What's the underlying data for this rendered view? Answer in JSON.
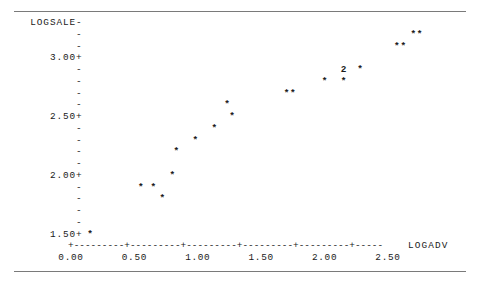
{
  "page": {
    "clipped_header_remnant": "-  -  - . - . -   -  .  -  -",
    "background_color": "#ffffff",
    "text_color": "#1a1a1a",
    "rule_color": "#7a7a7a"
  },
  "plot": {
    "type": "character-scatter",
    "y_axis": {
      "name": "LOGSALE",
      "tick_labels": [
        "3.00",
        "2.50",
        "2.00",
        "1.50"
      ],
      "major_tick_glyph": "+",
      "minor_tick_glyph": "-",
      "name_tick_glyph": "-",
      "rows": [
        {
          "label": "LOGSALE",
          "tick": "-",
          "value": 3.5
        },
        {
          "label": "",
          "tick": "-",
          "value": 3.375
        },
        {
          "label": "",
          "tick": "-",
          "value": 3.25
        },
        {
          "label": "3.00",
          "tick": "+",
          "value": 3.0
        },
        {
          "label": "",
          "tick": "-",
          "value": 2.875
        },
        {
          "label": "",
          "tick": "-",
          "value": 2.75
        },
        {
          "label": "",
          "tick": "-",
          "value": 2.625
        },
        {
          "label": "",
          "tick": "-",
          "value": 2.5625
        },
        {
          "label": "2.50",
          "tick": "+",
          "value": 2.5
        },
        {
          "label": "",
          "tick": "-",
          "value": 2.375
        },
        {
          "label": "",
          "tick": "-",
          "value": 2.25
        },
        {
          "label": "",
          "tick": "-",
          "value": 2.125
        },
        {
          "label": "",
          "tick": "-",
          "value": 2.0625
        },
        {
          "label": "2.00",
          "tick": "+",
          "value": 2.0
        },
        {
          "label": "",
          "tick": "-",
          "value": 1.875
        },
        {
          "label": "",
          "tick": "-",
          "value": 1.75
        },
        {
          "label": "",
          "tick": "-",
          "value": 1.625
        },
        {
          "label": "",
          "tick": "-",
          "value": 1.5625
        },
        {
          "label": "1.50",
          "tick": "+",
          "value": 1.5
        }
      ]
    },
    "x_axis": {
      "name": "LOGADV",
      "axis_line": "+---------+---------+---------+---------+---------+-----",
      "tick_labels": [
        "0.00",
        "0.50",
        "1.00",
        "1.50",
        "2.00",
        "2.50"
      ],
      "tick_values": [
        0.0,
        0.5,
        1.0,
        1.5,
        2.0,
        2.5
      ]
    },
    "marker_glyph": "*",
    "overlap_note": "a digit replaces * when that cell holds more than one observation"
  },
  "chart_data": {
    "type": "scatter",
    "title": "",
    "xlabel": "LOGADV",
    "ylabel": "LOGSALE",
    "xlim": [
      0.0,
      2.75
    ],
    "ylim": [
      1.4375,
      3.5625
    ],
    "grid": false,
    "legend": null,
    "marker": "*",
    "points": [
      {
        "x": 0.15,
        "y": 1.5,
        "glyph": "*",
        "n": 1
      },
      {
        "x": 0.55,
        "y": 1.875,
        "glyph": "*",
        "n": 1
      },
      {
        "x": 0.65,
        "y": 1.875,
        "glyph": "*",
        "n": 1
      },
      {
        "x": 0.72,
        "y": 1.75,
        "glyph": "*",
        "n": 1
      },
      {
        "x": 0.8,
        "y": 2.0,
        "glyph": "*",
        "n": 1
      },
      {
        "x": 0.83,
        "y": 2.125,
        "glyph": "*",
        "n": 1
      },
      {
        "x": 0.98,
        "y": 2.25,
        "glyph": "*",
        "n": 1
      },
      {
        "x": 1.13,
        "y": 2.375,
        "glyph": "*",
        "n": 1
      },
      {
        "x": 1.27,
        "y": 2.5,
        "glyph": "*",
        "n": 1
      },
      {
        "x": 1.23,
        "y": 2.5625,
        "glyph": "*",
        "n": 1
      },
      {
        "x": 1.7,
        "y": 2.625,
        "glyph": "*",
        "n": 1
      },
      {
        "x": 1.75,
        "y": 2.625,
        "glyph": "*",
        "n": 1
      },
      {
        "x": 2.0,
        "y": 2.75,
        "glyph": "*",
        "n": 1
      },
      {
        "x": 2.15,
        "y": 2.75,
        "glyph": "*",
        "n": 1
      },
      {
        "x": 2.15,
        "y": 2.875,
        "glyph": "2",
        "n": 2
      },
      {
        "x": 2.28,
        "y": 2.875,
        "glyph": "*",
        "n": 1
      },
      {
        "x": 2.57,
        "y": 3.25,
        "glyph": "*",
        "n": 1
      },
      {
        "x": 2.62,
        "y": 3.25,
        "glyph": "*",
        "n": 1
      },
      {
        "x": 2.7,
        "y": 3.375,
        "glyph": "*",
        "n": 1
      },
      {
        "x": 2.75,
        "y": 3.375,
        "glyph": "*",
        "n": 1
      }
    ],
    "x_tick_labels": [
      "0.00",
      "0.50",
      "1.00",
      "1.50",
      "2.00",
      "2.50"
    ],
    "y_tick_labels": [
      "3.00",
      "2.50",
      "2.00",
      "1.50"
    ],
    "annotations": [
      {
        "text": "2",
        "x": 2.15,
        "y": 2.875,
        "meaning": "2 coincident observations"
      }
    ],
    "n_observations": 21
  }
}
